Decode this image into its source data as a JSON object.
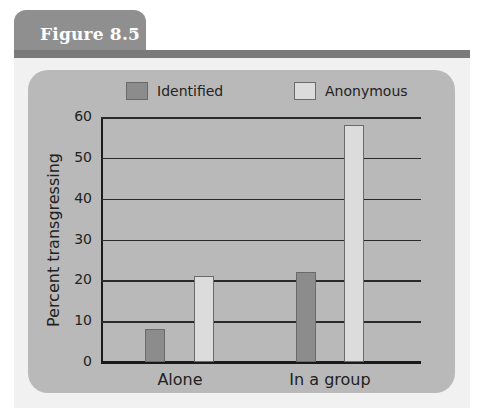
{
  "figure": {
    "label": "Figure 8.5"
  },
  "colors": {
    "identified": "#8c8c8c",
    "anonymous": "#dcdcdc",
    "panel": "#b9b9b9",
    "tab": "#8f8f8f",
    "header_bar": "#7a7a7a"
  },
  "legend": {
    "items": [
      {
        "label": "Identified"
      },
      {
        "label": "Anonymous"
      }
    ]
  },
  "axes": {
    "ylabel": "Percent transgressing",
    "yticks": [
      "60",
      "50",
      "40",
      "30",
      "20",
      "10",
      "0"
    ],
    "xticks": [
      "Alone",
      "In a group"
    ]
  },
  "chart_data": {
    "type": "bar",
    "title": "Figure 8.5",
    "categories": [
      "Alone",
      "In a group"
    ],
    "series": [
      {
        "name": "Identified",
        "values": [
          8,
          22
        ]
      },
      {
        "name": "Anonymous",
        "values": [
          21,
          58
        ]
      }
    ],
    "xlabel": "",
    "ylabel": "Percent transgressing",
    "ylim": [
      0,
      60
    ],
    "yticks": [
      0,
      10,
      20,
      30,
      40,
      50,
      60
    ],
    "grid": true,
    "legend_position": "top"
  }
}
